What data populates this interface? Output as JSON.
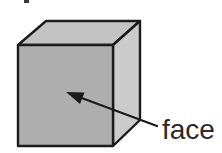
{
  "figure": {
    "type": "cube diagram",
    "label": "face"
  },
  "colors": {
    "background": "#ffffff",
    "front_face": "#aeaeae",
    "top_face": "#c3c3c3",
    "right_face": "#cbcbcb",
    "edge": "#1b1b1b",
    "arrow": "#1b1b1b",
    "label_text": "#2b2b2b",
    "fragment": "#3a3a3a"
  }
}
